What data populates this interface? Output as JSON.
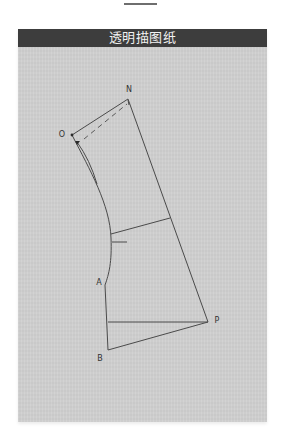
{
  "header": {
    "title": "透明描图纸"
  },
  "colors": {
    "header_bg": "#3d3d3d",
    "header_text": "#f2f2f2",
    "paper": "#d0d0d0",
    "line": "#4a4a4a"
  },
  "diagram": {
    "point_labels": {
      "N": "N",
      "O": "O",
      "A": "A",
      "B": "B",
      "P": "P"
    }
  }
}
